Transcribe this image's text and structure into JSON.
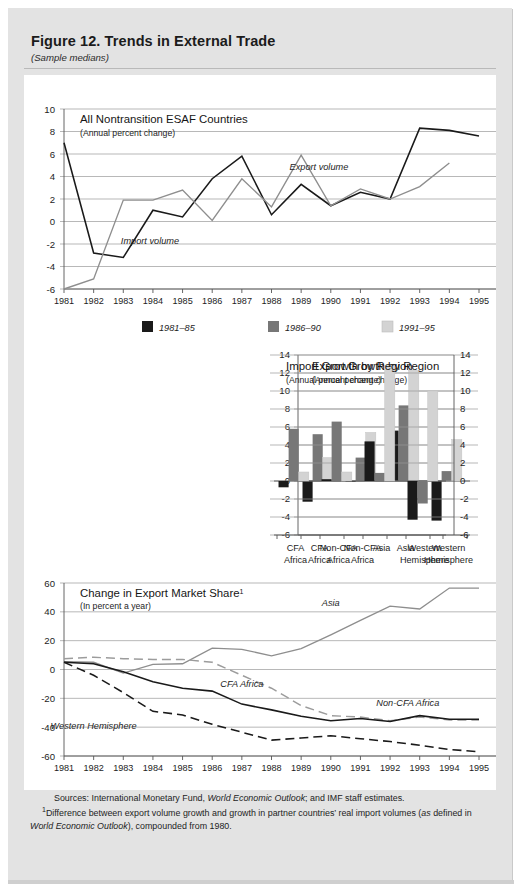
{
  "figure": {
    "title": "Figure 12. Trends in External Trade",
    "subtitle": "(Sample medians)"
  },
  "notes": {
    "sources_label": "Sources:",
    "sources_text_a": "International Monetary Fund,",
    "sources_italic_a": "World Economic Outlook",
    "sources_text_b": "; and IMF staff estimates.",
    "footnote_marker": "1",
    "footnote_a": "Difference between export volume growth and growth in partner countries’ real import volumes (",
    "footnote_italic_as": "as",
    "footnote_b": "defined in",
    "footnote_italic_weo": "World Economic Outlook",
    "footnote_c": "), compounded from 1980."
  },
  "legend": {
    "items": [
      {
        "label": "1981–85",
        "color": "#1a1a1a"
      },
      {
        "label": "1986–90",
        "color": "#777777"
      },
      {
        "label": "1991–95",
        "color": "#d3d3d3"
      }
    ]
  },
  "chart_data": [
    {
      "id": "panel-a",
      "type": "line",
      "title": "All Nontransition ESAF Countries",
      "subtitle": "(Annual percent change)",
      "xlabel": "",
      "ylabel": "",
      "ylim": [
        -6,
        10
      ],
      "yticks": [
        "10",
        "8",
        "6",
        "4",
        "2",
        "0",
        "-2",
        "-4",
        "-6"
      ],
      "ytick_values": [
        10,
        8,
        6,
        4,
        2,
        0,
        -2,
        -4,
        -6
      ],
      "grid": true,
      "x": [
        1981,
        1982,
        1983,
        1984,
        1985,
        1986,
        1987,
        1988,
        1989,
        1990,
        1991,
        1992,
        1993,
        1994,
        1995
      ],
      "xticks": [
        "1981",
        "1982",
        "1983",
        "1984",
        "1985",
        "1986",
        "1987",
        "1988",
        "1989",
        "1990",
        "1991",
        "1992",
        "1993",
        "1994",
        "1995"
      ],
      "series": [
        {
          "name": "Export volume",
          "color": "#1a1a1a",
          "style": "solid",
          "values": [
            7.0,
            -2.8,
            -3.2,
            1.0,
            0.4,
            3.8,
            5.8,
            0.6,
            3.3,
            1.4,
            2.6,
            2.0,
            8.3,
            8.1,
            7.6
          ]
        },
        {
          "name": "Import volume",
          "color": "#8e8e8e",
          "style": "solid",
          "values": [
            -6.0,
            -5.1,
            1.9,
            1.9,
            2.8,
            0.1,
            3.8,
            1.3,
            5.9,
            1.4,
            2.9,
            2.0,
            3.1,
            5.2,
            null
          ]
        }
      ],
      "annotations": [
        {
          "text": "Export volume",
          "x": 1989.6,
          "y": 4.6
        },
        {
          "text": "Import volume",
          "x": 1983.9,
          "y": -2.0
        }
      ]
    },
    {
      "id": "panel-b",
      "type": "bar",
      "title": "Export Growth by Region",
      "subtitle": "(Annual percent change)",
      "ylim": [
        -6,
        14
      ],
      "yticks": [
        "14",
        "12",
        "10",
        "8",
        "6",
        "4",
        "2",
        "0",
        "-2",
        "-4",
        "-6"
      ],
      "ytick_values": [
        14,
        12,
        10,
        8,
        6,
        4,
        2,
        0,
        -2,
        -4,
        -6
      ],
      "grid": true,
      "categories": [
        "CFA\nAfrica",
        "Non-CFA\nAfrica",
        "Asia",
        "Western\nHemisphere"
      ],
      "category_lines": [
        [
          "CFA",
          "Africa"
        ],
        [
          "Non-CFA",
          "Africa"
        ],
        [
          "Asia",
          ""
        ],
        [
          "Western",
          "Hemisphere"
        ]
      ],
      "series": [
        {
          "name": "1981–85",
          "color": "#1a1a1a",
          "values": [
            -2.3,
            -0.1,
            5.6,
            -4.4
          ]
        },
        {
          "name": "1986–90",
          "color": "#777777",
          "values": [
            5.2,
            2.6,
            8.4,
            1.1
          ]
        },
        {
          "name": "1991–95",
          "color": "#d3d3d3",
          "values": [
            2.6,
            5.4,
            12.3,
            4.6
          ]
        }
      ]
    },
    {
      "id": "panel-c",
      "type": "bar",
      "title": "Import Growth by Region",
      "subtitle": "(Annual percent change)",
      "ylim": [
        -6,
        14
      ],
      "yticks": [
        "14",
        "12",
        "10",
        "8",
        "6",
        "4",
        "2",
        "0",
        "-2",
        "-4",
        "-6"
      ],
      "ytick_values": [
        14,
        12,
        10,
        8,
        6,
        4,
        2,
        0,
        -2,
        -4,
        -6
      ],
      "grid": true,
      "categories": [
        "CFA\nAfrica",
        "Non-CFA\nAfrica",
        "Asia",
        "Western\nHemisphere"
      ],
      "category_lines": [
        [
          "CFA",
          "Africa"
        ],
        [
          "Non-CFA",
          "Africa"
        ],
        [
          "Asia",
          ""
        ],
        [
          "Western",
          "Hemisphere"
        ]
      ],
      "series": [
        {
          "name": "1981–85",
          "color": "#1a1a1a",
          "values": [
            -0.7,
            0.2,
            4.4,
            -4.3
          ]
        },
        {
          "name": "1986–90",
          "color": "#777777",
          "values": [
            5.8,
            6.6,
            0.9,
            -2.5
          ]
        },
        {
          "name": "1991–95",
          "color": "#d3d3d3",
          "values": [
            1.0,
            1.0,
            12.8,
            10.0
          ]
        }
      ]
    },
    {
      "id": "panel-d",
      "type": "line",
      "title": "Change in Export Market Share",
      "title_superscript": "1",
      "subtitle": "(In percent a year)",
      "ylim": [
        -60,
        60
      ],
      "yticks": [
        "60",
        "40",
        "20",
        "0",
        "-20",
        "-40",
        "-60"
      ],
      "ytick_values": [
        60,
        40,
        20,
        0,
        -20,
        -40,
        -60
      ],
      "grid": true,
      "x": [
        1981,
        1982,
        1983,
        1984,
        1985,
        1986,
        1987,
        1988,
        1989,
        1990,
        1991,
        1992,
        1993,
        1994,
        1995
      ],
      "xticks": [
        "1981",
        "1982",
        "1983",
        "1984",
        "1985",
        "1986",
        "1987",
        "1988",
        "1989",
        "1990",
        "1991",
        "1992",
        "1993",
        "1994",
        "1995"
      ],
      "series": [
        {
          "name": "Asia",
          "color": "#8e8e8e",
          "style": "solid",
          "values": [
            5.5,
            5.0,
            -2.5,
            3.5,
            4.0,
            14.8,
            14.0,
            9.5,
            14.5,
            24.0,
            34.0,
            44.0,
            42.0,
            56.5,
            56.5
          ]
        },
        {
          "name": "CFA Africa",
          "color": "#9c9c9c",
          "style": "dashed",
          "values": [
            7.5,
            8.5,
            7.5,
            7.0,
            7.0,
            5.0,
            -4.0,
            -13.0,
            -25.0,
            -32.0,
            -33.0,
            -35.5,
            -33.0,
            -35.0,
            -35.0
          ]
        },
        {
          "name": "Non-CFA Africa",
          "color": "#1a1a1a",
          "style": "solid",
          "values": [
            5.0,
            4.0,
            -1.5,
            -8.5,
            -13.0,
            -15.0,
            -24.0,
            -28.0,
            -32.5,
            -35.5,
            -34.0,
            -36.0,
            -32.0,
            -34.5,
            -34.5
          ]
        },
        {
          "name": "Western Hemisphere",
          "color": "#1a1a1a",
          "style": "dashed",
          "values": [
            5.0,
            -4.0,
            -16.0,
            -29.0,
            -31.5,
            -38.0,
            -43.5,
            -49.0,
            -47.5,
            -46.0,
            -48.0,
            -50.0,
            -52.5,
            -55.5,
            -57.0
          ]
        }
      ],
      "annotations": [
        {
          "text": "Asia",
          "x": 1990.0,
          "y": 44.0
        },
        {
          "text": "CFA Africa",
          "x": 1987.0,
          "y": -12.0
        },
        {
          "text": "Non-CFA Africa",
          "x": 1992.6,
          "y": -25.0
        },
        {
          "text": "Western Hemisphere",
          "x": 1982.0,
          "y": -41.0
        }
      ]
    }
  ]
}
